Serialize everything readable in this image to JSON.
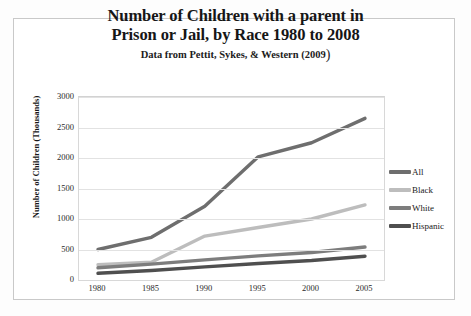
{
  "figure": {
    "title_line1": "Number of Children with a parent in",
    "title_line2": "Prison or Jail, by Race 1980 to 2008",
    "subtitle_text": "Data from Pettit, Sykes, & Western (2009",
    "subtitle_close_paren": ")"
  },
  "chart_data": {
    "type": "line",
    "title": "Number of Children with a parent in Prison or Jail, by Race 1980 to 2008",
    "subtitle": "Data from Pettit, Sykes, & Western (2009)",
    "xlabel": "",
    "ylabel": "Number of Children  (Thousands)",
    "x": [
      1980,
      1985,
      1990,
      1995,
      2000,
      2005
    ],
    "categories": [
      "1980",
      "1985",
      "1990",
      "1995",
      "2000",
      "2005"
    ],
    "xtick_labels": [
      "1980",
      "1985",
      "1990",
      "1995",
      "2000",
      "2005"
    ],
    "ytick_labels": [
      "0",
      "500",
      "1000",
      "1500",
      "2000",
      "2500",
      "3000"
    ],
    "yticks": [
      0,
      500,
      1000,
      1500,
      2000,
      2500,
      3000
    ],
    "ylim": [
      0,
      3000
    ],
    "xlim": [
      1980,
      2005
    ],
    "grid": true,
    "legend_position": "right",
    "series": [
      {
        "name": "All",
        "color": "#6e6e6e",
        "values": [
          500,
          700,
          1210,
          2020,
          2250,
          2650
        ]
      },
      {
        "name": "Black",
        "color": "#bdbdbd",
        "values": [
          250,
          290,
          720,
          860,
          1000,
          1230
        ]
      },
      {
        "name": "White",
        "color": "#7d7d7d",
        "values": [
          200,
          260,
          330,
          395,
          450,
          540
        ]
      },
      {
        "name": "Hispanic",
        "color": "#4f4f4f",
        "values": [
          110,
          155,
          215,
          270,
          320,
          390
        ]
      }
    ]
  },
  "legend": {
    "items": [
      {
        "label": "All",
        "color": "#6e6e6e"
      },
      {
        "label": "Black",
        "color": "#bdbdbd"
      },
      {
        "label": "White",
        "color": "#7d7d7d"
      },
      {
        "label": "Hispanic",
        "color": "#4f4f4f"
      }
    ]
  }
}
